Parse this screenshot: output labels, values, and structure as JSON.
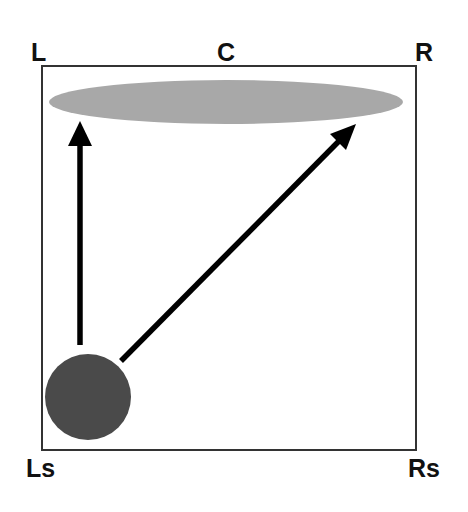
{
  "diagram": {
    "speakers": {
      "front_left": "L",
      "center": "C",
      "front_right": "R",
      "left_surround": "Ls",
      "right_surround": "Rs"
    },
    "elements": {
      "front_image": {
        "shape": "ellipse",
        "color": "#a8a8a8",
        "meaning": "spread front sound image"
      },
      "source": {
        "shape": "circle",
        "color": "#4a4a4a",
        "meaning": "sound source near Ls"
      },
      "arrows": [
        {
          "from": "Ls source",
          "to": "L side of front image",
          "direction": "straight up"
        },
        {
          "from": "Ls source",
          "to": "R side of front image",
          "direction": "diagonal"
        }
      ]
    },
    "colors": {
      "frame": "#333333",
      "arrow": "#000000",
      "label": "#111111"
    }
  }
}
